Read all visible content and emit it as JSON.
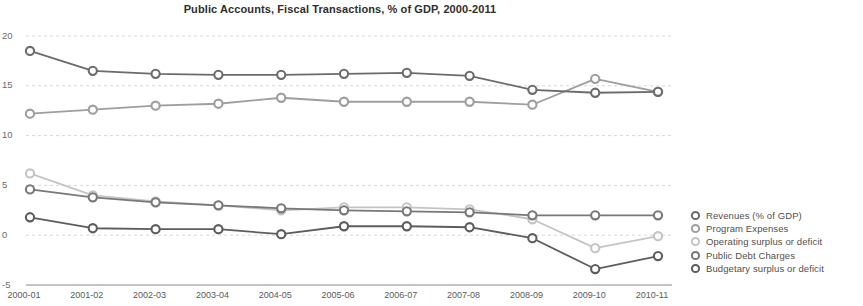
{
  "chart_data": {
    "type": "line",
    "title": "Public Accounts, Fiscal Transactions, % of GDP, 2000-2011",
    "xlabel": "",
    "ylabel": "",
    "ylim": [
      -5,
      20
    ],
    "yticks": [
      20,
      15,
      10,
      5,
      0,
      -5
    ],
    "ytick_labels": [
      "20",
      "15",
      "10",
      "5",
      "0",
      "-5"
    ],
    "grid": true,
    "legend_position": "right",
    "categories": [
      "2000-01",
      "2001-02",
      "2002-03",
      "2003-04",
      "2004-05",
      "2005-06",
      "2006-07",
      "2007-08",
      "2008-09",
      "2009-10",
      "2010-11"
    ],
    "series": [
      {
        "name": "Revenues (% of GDP)",
        "color": "#6b6b6b",
        "marker": "circle-open",
        "values": [
          18.5,
          16.5,
          16.2,
          16.1,
          16.1,
          16.2,
          16.3,
          16.0,
          14.6,
          14.3,
          14.4
        ]
      },
      {
        "name": "Program Expenses",
        "color": "#9e9e9e",
        "marker": "circle-open",
        "values": [
          12.2,
          12.6,
          13.0,
          13.2,
          13.8,
          13.4,
          13.4,
          13.4,
          13.1,
          15.7,
          14.4
        ]
      },
      {
        "name": "Operating surplus or deficit",
        "color": "#c4c4c4",
        "marker": "circle-open",
        "values": [
          6.2,
          4.0,
          3.4,
          3.0,
          2.5,
          2.8,
          2.8,
          2.6,
          1.6,
          -1.3,
          -0.1
        ]
      },
      {
        "name": "Public Debt Charges",
        "color": "#787878",
        "marker": "circle-open",
        "values": [
          4.6,
          3.8,
          3.3,
          3.0,
          2.7,
          2.5,
          2.4,
          2.3,
          2.0,
          2.0,
          2.0
        ]
      },
      {
        "name": "Budgetary surplus or deficit",
        "color": "#5d5d5d",
        "marker": "circle-open",
        "values": [
          1.8,
          0.7,
          0.6,
          0.6,
          0.1,
          0.9,
          0.9,
          0.8,
          -0.3,
          -3.4,
          -2.1
        ]
      }
    ]
  },
  "legend": {
    "items": [
      {
        "label": "Revenues (% of GDP)"
      },
      {
        "label": "Program Expenses"
      },
      {
        "label": "Operating surplus or deficit"
      },
      {
        "label": "Public Debt Charges"
      },
      {
        "label": "Budgetary surplus or deficit"
      }
    ]
  }
}
